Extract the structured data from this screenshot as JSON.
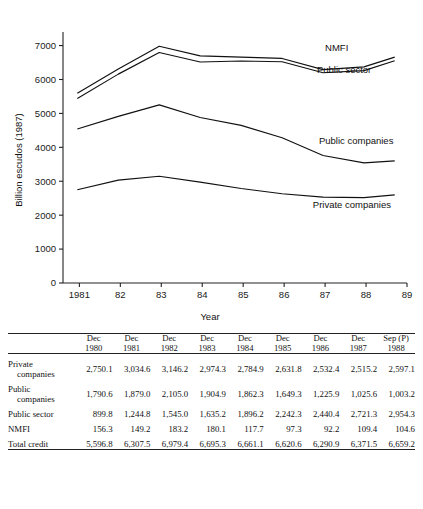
{
  "chart_data": {
    "type": "line",
    "title": "",
    "xlabel": "Year",
    "ylabel": "Billion escudos (1987)",
    "ylim": [
      0,
      7400
    ],
    "xlim": [
      1980.6,
      1989.0
    ],
    "yticks": [
      0,
      1000,
      2000,
      3000,
      4000,
      5000,
      6000,
      7000
    ],
    "ytick_labels": [
      "0",
      "1000",
      "2000",
      "3000",
      "4000",
      "5000",
      "6000",
      "7000"
    ],
    "xticks": [
      1981,
      1982,
      1983,
      1984,
      1985,
      1986,
      1987,
      1988,
      1989
    ],
    "xtick_labels": [
      "1981",
      "82",
      "83",
      "84",
      "85",
      "86",
      "87",
      "88",
      "89"
    ],
    "grid": false,
    "legend_position": "inline-right-of-lines",
    "x": [
      1980.95,
      1981.95,
      1982.95,
      1983.95,
      1984.95,
      1985.95,
      1986.95,
      1987.95,
      1988.7
    ],
    "series": [
      {
        "name": "NMFI",
        "label": "NMFI",
        "label_x": 1987.0,
        "label_y": 6850,
        "values": [
          5596.8,
          6307.5,
          6979.4,
          6695.3,
          6661.1,
          6620.6,
          6290.9,
          6371.5,
          6659.2
        ]
      },
      {
        "name": "Public sector",
        "label": "Public sector",
        "label_x": 1986.8,
        "label_y": 6180,
        "values": [
          5440.5,
          6158.3,
          6796.2,
          6515.2,
          6543.4,
          6523.3,
          6198.7,
          6262.1,
          6554.6
        ]
      },
      {
        "name": "Public companies",
        "label": "Public companies",
        "label_x": 1986.85,
        "label_y": 4110,
        "values": [
          4540.7,
          4913.5,
          5251.2,
          4879.5,
          4647.2,
          4281.1,
          3758.3,
          3540.8,
          3600.3
        ]
      },
      {
        "name": "Private companies",
        "label": "Private companies",
        "label_x": 1986.7,
        "label_y": 2220,
        "values": [
          2750.1,
          3034.6,
          3146.2,
          2974.3,
          2784.9,
          2631.8,
          2532.4,
          2515.2,
          2597.1
        ]
      }
    ]
  },
  "table": {
    "corner_label": "",
    "columns": [
      {
        "month": "Dec",
        "year": "1980"
      },
      {
        "month": "Dec",
        "year": "1981"
      },
      {
        "month": "Dec",
        "year": "1982"
      },
      {
        "month": "Dec",
        "year": "1983"
      },
      {
        "month": "Dec",
        "year": "1984"
      },
      {
        "month": "Dec",
        "year": "1985"
      },
      {
        "month": "Dec",
        "year": "1986"
      },
      {
        "month": "Dec",
        "year": "1987"
      },
      {
        "month": "Sep (P)",
        "year": "1988"
      }
    ],
    "rows": [
      {
        "label_line1": "Private",
        "label_line2": "companies",
        "values": [
          "2,750.1",
          "3,034.6",
          "3,146.2",
          "2,974.3",
          "2,784.9",
          "2,631.8",
          "2,532.4",
          "2,515.2",
          "2,597.1"
        ]
      },
      {
        "label_line1": "Public",
        "label_line2": "companies",
        "values": [
          "1,790.6",
          "1,879.0",
          "2,105.0",
          "1,904.9",
          "1,862.3",
          "1,649.3",
          "1,225.9",
          "1,025.6",
          "1,003.2"
        ]
      },
      {
        "label_line1": "Public sector",
        "label_line2": "",
        "values": [
          "899.8",
          "1,244.8",
          "1,545.0",
          "1,635.2",
          "1,896.2",
          "2,242.3",
          "2,440.4",
          "2,721.3",
          "2,954.3"
        ]
      },
      {
        "label_line1": "NMFI",
        "label_line2": "",
        "values": [
          "156.3",
          "149.2",
          "183.2",
          "180.1",
          "117.7",
          "97.3",
          "92.2",
          "109.4",
          "104.6"
        ]
      },
      {
        "label_line1": "Total credit",
        "label_line2": "",
        "values": [
          "5,596.8",
          "6,307.5",
          "6,979.4",
          "6,695.3",
          "6,661.1",
          "6,620.6",
          "6,290.9",
          "6,371.5",
          "6,659.2"
        ]
      }
    ]
  },
  "footnote": {
    "text": ""
  }
}
